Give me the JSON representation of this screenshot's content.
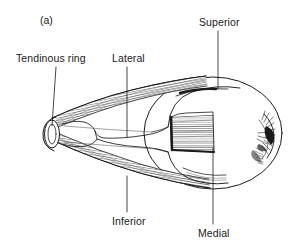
{
  "figure": {
    "panel_letter": "(a)",
    "background_color": "#ffffff",
    "ink_color": "#1a1a1a",
    "labels": [
      {
        "id": "tendinous-ring",
        "text": "Tendinous ring",
        "text_x": 16,
        "text_y": 52,
        "leader": {
          "x1": 56,
          "y1": 67,
          "x2": 52,
          "y2": 126
        }
      },
      {
        "id": "lateral",
        "text": "Lateral",
        "text_x": 112,
        "text_y": 52,
        "leader": {
          "x1": 127,
          "y1": 67,
          "x2": 127,
          "y2": 137
        }
      },
      {
        "id": "superior",
        "text": "Superior",
        "text_x": 199,
        "text_y": 16,
        "leader": {
          "x1": 218,
          "y1": 31,
          "x2": 218,
          "y2": 89
        }
      },
      {
        "id": "inferior",
        "text": "Inferior",
        "text_x": 112,
        "text_y": 215,
        "leader": {
          "x1": 127,
          "y1": 176,
          "x2": 127,
          "y2": 212
        }
      },
      {
        "id": "medial",
        "text": "Medial",
        "text_x": 198,
        "text_y": 227,
        "leader": {
          "x1": 213,
          "y1": 148,
          "x2": 213,
          "y2": 224
        }
      }
    ]
  }
}
